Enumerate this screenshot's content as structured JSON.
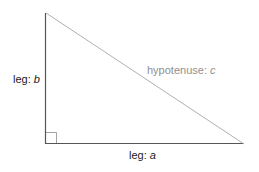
{
  "diagram": {
    "labels": {
      "leg_b": {
        "prefix": "leg: ",
        "var": "b"
      },
      "leg_a": {
        "prefix": "leg: ",
        "var": "a"
      },
      "hypotenuse": {
        "prefix": "hypotenuse: ",
        "var": "c"
      }
    },
    "colors": {
      "legs": "#555555",
      "hypotenuse": "#b0b0b0",
      "label_dark": "#222222",
      "label_light": "#909090",
      "right_angle_marker": "#999999"
    }
  }
}
